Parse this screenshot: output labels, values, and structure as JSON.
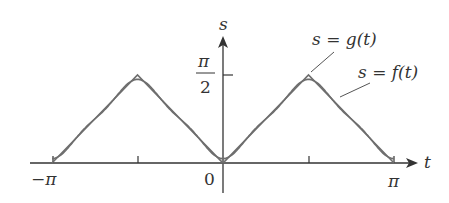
{
  "chart_data": {
    "type": "line",
    "title": "",
    "xlabel": "t",
    "ylabel": "s",
    "xlim": [
      -3.14159,
      3.14159
    ],
    "ylim": [
      0,
      1.5708
    ],
    "x_ticks": [
      {
        "value": -3.14159,
        "label": "−π"
      },
      {
        "value": -1.5708,
        "label": ""
      },
      {
        "value": 0,
        "label": "0"
      },
      {
        "value": 1.5708,
        "label": ""
      },
      {
        "value": 3.14159,
        "label": "π"
      }
    ],
    "y_ticks": [
      {
        "value": 1.5708,
        "label": "π/2"
      }
    ],
    "grid": false,
    "series": [
      {
        "name": "s = g(t)",
        "description": "triangle wave, zero at t = −π, 0, π and peak π/2 at t = ±π/2",
        "x": [
          -3.14159,
          -1.5708,
          0,
          1.5708,
          3.14159
        ],
        "y": [
          0,
          1.5708,
          0,
          1.5708,
          0
        ]
      },
      {
        "name": "s = f(t)",
        "description": "smooth Fourier-type approximation of g(t), closely following it"
      }
    ],
    "annotations": [
      {
        "text": "s = g(t)",
        "points_to": "peak near t = π/2"
      },
      {
        "text": "s = f(t)",
        "points_to": "descending segment right of t = π/2"
      }
    ]
  },
  "labels": {
    "s_axis": "s",
    "t_axis": "t",
    "pi_half_num": "π",
    "pi_half_den": "2",
    "neg_pi": "−π",
    "zero": "0",
    "pi": "π",
    "g_label": "s = g(t)",
    "f_label": "s = f(t)"
  },
  "colors": {
    "axis": "#333333",
    "curve": "#6e6e6e"
  }
}
